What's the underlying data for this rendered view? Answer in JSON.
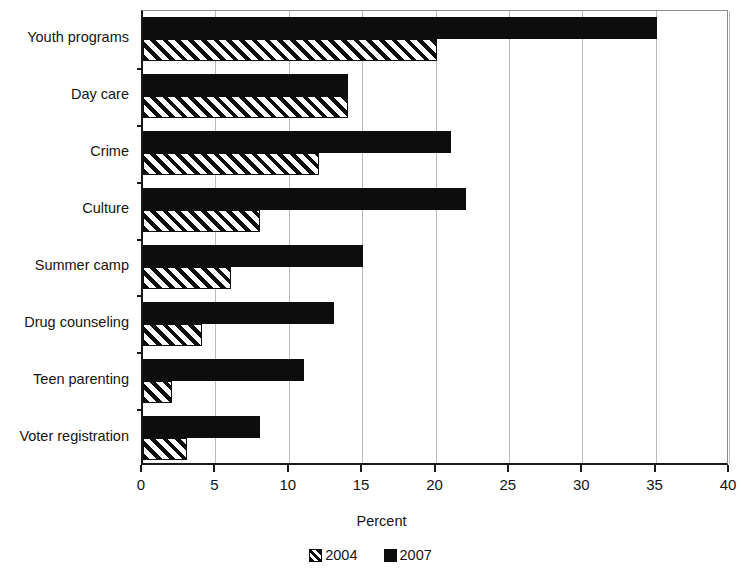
{
  "chart_data": {
    "type": "bar",
    "orientation": "horizontal",
    "title": "",
    "subtitle": "",
    "xlabel": "Percent",
    "ylabel": "",
    "xlim": [
      0,
      40
    ],
    "xticks": [
      0,
      5,
      10,
      15,
      20,
      25,
      30,
      35,
      40
    ],
    "grid": "vertical",
    "legend_position": "bottom",
    "categories": [
      "Youth programs",
      "Day care",
      "Crime",
      "Culture",
      "Summer camp",
      "Drug counseling",
      "Teen parenting",
      "Voter registration"
    ],
    "series": [
      {
        "name": "2004",
        "pattern": "diagonal-hatch",
        "color": "#0d0d0d",
        "values": [
          20,
          14,
          12,
          8,
          6,
          4,
          2,
          3
        ]
      },
      {
        "name": "2007",
        "pattern": "solid",
        "color": "#0d0d0d",
        "values": [
          35,
          14,
          21,
          22,
          15,
          13,
          11,
          8
        ]
      }
    ]
  },
  "axis": {
    "x_title": "Percent",
    "tick_labels": [
      "0",
      "5",
      "10",
      "15",
      "20",
      "25",
      "30",
      "35",
      "40"
    ]
  },
  "legend": {
    "items": [
      {
        "label": "2004",
        "swatch": "hatch-swatch-icon"
      },
      {
        "label": "2007",
        "swatch": "solid-swatch-icon"
      }
    ]
  },
  "colors": {
    "ink": "#0d0d0d",
    "gridline": "#b9b9b9",
    "axis": "#1a1a1a",
    "background": "#ffffff"
  }
}
